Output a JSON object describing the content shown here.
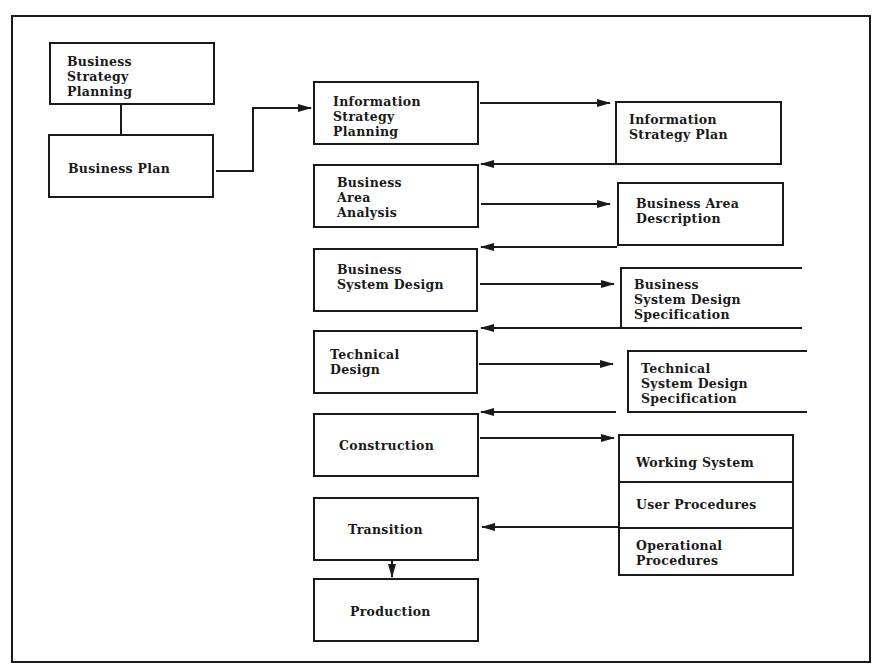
{
  "diagram": {
    "type": "information-engineering-lifecycle",
    "left_nodes": [
      {
        "id": "bsp",
        "label": "Business\nStrategy\nPlanning"
      },
      {
        "id": "bp",
        "label": "Business Plan"
      }
    ],
    "stage_nodes": [
      {
        "id": "isp",
        "label": "Information\nStrategy\nPlanning"
      },
      {
        "id": "baa",
        "label": "Business\nArea\nAnalysis"
      },
      {
        "id": "bsd",
        "label": "Business\nSystem Design"
      },
      {
        "id": "td",
        "label": "Technical\nDesign"
      },
      {
        "id": "con",
        "label": "Construction"
      },
      {
        "id": "tra",
        "label": "Transition"
      },
      {
        "id": "pro",
        "label": "Production"
      }
    ],
    "output_nodes": [
      {
        "id": "ispl",
        "label": "Information\nStrategy Plan"
      },
      {
        "id": "bad",
        "label": "Business Area\nDescription"
      },
      {
        "id": "bsds",
        "label": "Business\nSystem Design\nSpecification"
      },
      {
        "id": "tsds",
        "label": "Technical\nSystem Design\nSpecification"
      }
    ],
    "deliverables": {
      "id": "deliv",
      "segments": [
        "Working System",
        "User Procedures",
        "Operational\nProcedures"
      ]
    },
    "edges": [
      {
        "from": "bsp",
        "to": "bp",
        "arrow": false
      },
      {
        "from": "bp",
        "to": "isp"
      },
      {
        "from": "isp",
        "to": "ispl"
      },
      {
        "from": "ispl",
        "to": "baa"
      },
      {
        "from": "baa",
        "to": "bad"
      },
      {
        "from": "bad",
        "to": "bsd"
      },
      {
        "from": "bsd",
        "to": "bsds"
      },
      {
        "from": "bsds",
        "to": "td"
      },
      {
        "from": "td",
        "to": "tsds"
      },
      {
        "from": "tsds",
        "to": "con"
      },
      {
        "from": "con",
        "to": "deliv"
      },
      {
        "from": "deliv",
        "to": "tra"
      },
      {
        "from": "tra",
        "to": "pro"
      }
    ]
  }
}
